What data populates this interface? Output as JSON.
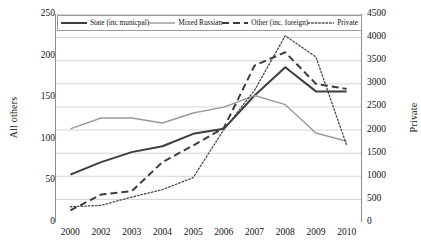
{
  "chart_data": {
    "type": "line",
    "title": "",
    "xlabel": "",
    "ylabel": "All others",
    "y2label": "Private",
    "categories": [
      "2000",
      "2002",
      "2003",
      "2004",
      "2005",
      "2006",
      "2007",
      "2008",
      "2009",
      "2010"
    ],
    "ylim": [
      0,
      250
    ],
    "yticks": [
      0,
      50,
      100,
      150,
      200,
      250
    ],
    "y2lim": [
      0,
      4500
    ],
    "y2ticks": [
      0,
      500,
      1000,
      1500,
      2000,
      2500,
      3000,
      3500,
      4000,
      4500
    ],
    "grid": true,
    "legend_position": "top-inside",
    "series": [
      {
        "name": "State (inc municpal)",
        "axis": "left",
        "style": "solid",
        "color": "#3d3d3d",
        "width": 2.0,
        "values": [
          57,
          72,
          84,
          91,
          106,
          112,
          152,
          186,
          157,
          157
        ]
      },
      {
        "name": "Mixed Russian",
        "axis": "left",
        "style": "solid",
        "color": "#9a9a9a",
        "width": 1.4,
        "values": [
          112,
          125,
          125,
          119,
          131,
          138,
          152,
          141,
          107,
          97
        ]
      },
      {
        "name": "Other (inc. foreign)",
        "axis": "left",
        "style": "dashed",
        "color": "#3d3d3d",
        "width": 2.0,
        "values": [
          14,
          33,
          37,
          72,
          92,
          113,
          188,
          204,
          166,
          160
        ]
      },
      {
        "name": "Private",
        "axis": "right",
        "style": "dotted",
        "color": "#4a4a4a",
        "width": 1.3,
        "values": [
          330,
          360,
          540,
          700,
          960,
          2000,
          2850,
          4030,
          3570,
          1660
        ]
      }
    ]
  },
  "legend": {
    "items": [
      {
        "label": "State (inc municpal)",
        "icon": "solid-line-swatch"
      },
      {
        "label": "Mixed Russian",
        "icon": "solid-line-swatch"
      },
      {
        "label": "Other (inc. foreign)",
        "icon": "dashed-line-swatch"
      },
      {
        "label": "Private",
        "icon": "dotted-line-swatch"
      }
    ]
  },
  "axes": {
    "left_title": "All others",
    "right_title": "Private",
    "left_ticks": [
      "250",
      "200",
      "150",
      "100",
      "50",
      "0"
    ],
    "right_ticks": [
      "4500",
      "4000",
      "3500",
      "3000",
      "2500",
      "2000",
      "1500",
      "1000",
      "500",
      "0"
    ],
    "x_ticks": [
      "2000",
      "2002",
      "2003",
      "2004",
      "2005",
      "2006",
      "2007",
      "2008",
      "2009",
      "2010"
    ]
  },
  "colors": {
    "state": "#3d3d3d",
    "mixed": "#9a9a9a",
    "other": "#3d3d3d",
    "private": "#4a4a4a",
    "grid": "#d4d4d4",
    "axis": "#8c8c8c"
  }
}
